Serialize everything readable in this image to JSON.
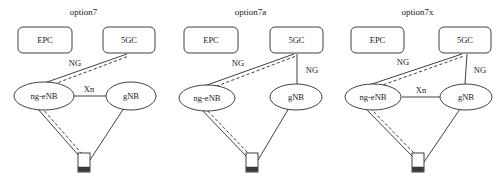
{
  "figure": {
    "background_color": "#ffffff",
    "line_color": "#2b2b2b"
  },
  "panels": [
    {
      "id": "option7",
      "title": "option7",
      "nodes": {
        "epc": "EPC",
        "fivegc": "5GC",
        "ng_enb": "ng-eNB",
        "gnb": "gNB",
        "ue": "UE"
      },
      "links": {
        "ng_enb_to_5gc": "NG",
        "gnb_to_5gc": "",
        "xn": "Xn"
      },
      "has_xn": true,
      "has_gnb_ng": false
    },
    {
      "id": "option7a",
      "title": "option7a",
      "nodes": {
        "epc": "EPC",
        "fivegc": "5GC",
        "ng_enb": "ng-eNB",
        "gnb": "gNB",
        "ue": "UE"
      },
      "links": {
        "ng_enb_to_5gc": "NG",
        "gnb_to_5gc": "NG",
        "xn": ""
      },
      "has_xn": false,
      "has_gnb_ng": true
    },
    {
      "id": "option7x",
      "title": "option7x",
      "nodes": {
        "epc": "EPC",
        "fivegc": "5GC",
        "ng_enb": "ng-eNB",
        "gnb": "gNB",
        "ue": "UE"
      },
      "links": {
        "ng_enb_to_5gc": "NG",
        "gnb_to_5gc": "NG",
        "xn": "Xn"
      },
      "has_xn": true,
      "has_gnb_ng": true
    }
  ]
}
